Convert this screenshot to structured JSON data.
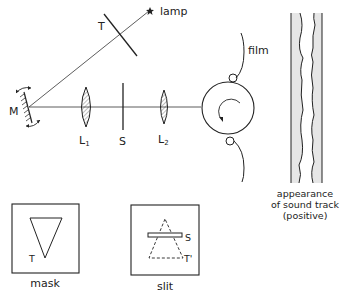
{
  "diagram": {
    "labels": {
      "lamp": "lamp",
      "filter": "T",
      "mirror": "M",
      "lens1": "L",
      "lens1_sub": "1",
      "slit": "S",
      "lens2": "L",
      "lens2_sub": "2",
      "film": "film",
      "sound_track_caption_line1": "appearance",
      "sound_track_caption_line2": "of sound track",
      "sound_track_caption_line3": "(positive)",
      "mask_caption": "mask",
      "mask_triangle": "T",
      "slit_caption": "slit",
      "slit_bar": "S",
      "slit_triangle": "T'"
    },
    "components": [
      {
        "id": "lamp",
        "shape": "star"
      },
      {
        "id": "T",
        "shape": "filter-mask-line"
      },
      {
        "id": "M",
        "shape": "oscillating-mirror"
      },
      {
        "id": "L1",
        "shape": "convex-lens"
      },
      {
        "id": "S",
        "shape": "slit"
      },
      {
        "id": "L2",
        "shape": "convex-lens"
      },
      {
        "id": "drum",
        "shape": "rotating-drum"
      },
      {
        "id": "film",
        "shape": "film-path"
      },
      {
        "id": "sound-track",
        "shape": "variable-area-track"
      },
      {
        "id": "mask",
        "shape": "triangle-mask-box"
      },
      {
        "id": "slit-view",
        "shape": "slit-box"
      }
    ],
    "colors": {
      "ink": "#222222",
      "track_fill": "#e6e6e6"
    }
  }
}
